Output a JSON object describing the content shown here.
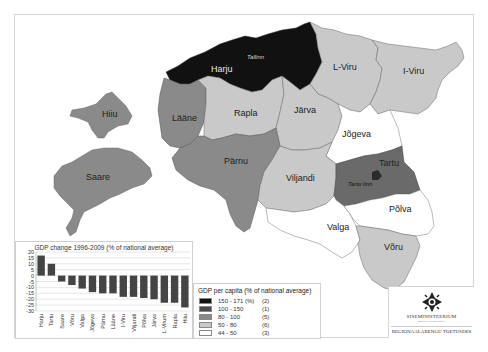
{
  "map": {
    "title": "GDP per capita by county, Estonia",
    "regions": [
      {
        "name": "Harju",
        "class": "150 - 171",
        "fill": "#111111"
      },
      {
        "name": "Tartu",
        "class": "100 - 150",
        "fill": "#6a6a6a"
      },
      {
        "name": "Hiiu",
        "class": "80 - 100",
        "fill": "#8a8a8a"
      },
      {
        "name": "Saare",
        "class": "80 - 100",
        "fill": "#8a8a8a"
      },
      {
        "name": "Lääne",
        "class": "80 - 100",
        "fill": "#8a8a8a"
      },
      {
        "name": "Pärnu",
        "class": "80 - 100",
        "fill": "#8a8a8a"
      },
      {
        "name": "Rapla",
        "class": "50 - 80",
        "fill": "#c9c9c9"
      },
      {
        "name": "Järva",
        "class": "50 - 80",
        "fill": "#c9c9c9"
      },
      {
        "name": "L-Viru",
        "class": "50 - 80",
        "fill": "#c9c9c9"
      },
      {
        "name": "I-Viru",
        "class": "50 - 80",
        "fill": "#c9c9c9"
      },
      {
        "name": "Viljandi",
        "class": "50 - 80",
        "fill": "#c9c9c9"
      },
      {
        "name": "Võru",
        "class": "50 - 80",
        "fill": "#c9c9c9"
      },
      {
        "name": "Jõgeva",
        "class": "44 - 50",
        "fill": "#ffffff"
      },
      {
        "name": "Valga",
        "class": "44 - 50",
        "fill": "#ffffff"
      },
      {
        "name": "Põlva",
        "class": "44 - 50",
        "fill": "#ffffff"
      }
    ],
    "labels": {
      "harju": "Harju",
      "tallinn": "Tallinn",
      "l_viru": "L-Viru",
      "i_viru": "I-Viru",
      "hiiu": "Hiiu",
      "laane": "Lääne",
      "rapla": "Rapla",
      "jarva": "Järva",
      "jogeva": "Jõgeva",
      "saare": "Saare",
      "parnu": "Pärnu",
      "viljandi": "Viljandi",
      "tartu": "Tartu",
      "tartu_linn": "Tartu linn",
      "valga": "Valga",
      "polva": "Põlva",
      "voru": "Võru"
    }
  },
  "legend": {
    "title": "GDP per capita (% of national average)",
    "items": [
      {
        "range": "150 - 171 (%)",
        "count": "(2)",
        "color": "#111111"
      },
      {
        "range": "100 - 150",
        "count": "(1)",
        "color": "#4a4a4a"
      },
      {
        "range": "80 - 100",
        "count": "(5)",
        "color": "#8a8a8a"
      },
      {
        "range": "50 - 80",
        "count": "(6)",
        "color": "#c9c9c9"
      },
      {
        "range": "44 - 50",
        "count": "(3)",
        "color": "#ffffff"
      }
    ]
  },
  "chart_data": {
    "type": "bar",
    "title": "GDP change 1996-2009 (% of national average)",
    "xlabel": "",
    "ylabel": "",
    "categories": [
      "Harju",
      "Tartu",
      "Saare",
      "Võru",
      "Valga",
      "Jõgeva",
      "Pärnu",
      "Lääne",
      "I-Viru",
      "Viljandi",
      "Põlva",
      "Järva",
      "L-Virum",
      "Rapla",
      "Hiiu"
    ],
    "values": [
      17,
      10,
      -5,
      -8,
      -11,
      -14,
      -15,
      -15,
      -18,
      -18,
      -19,
      -20,
      -23,
      -23,
      -27
    ],
    "yticks": [
      20,
      15,
      10,
      5,
      0,
      -5,
      -10,
      -15,
      -20,
      -25,
      -30
    ],
    "ytick_labels": [
      "20",
      "15",
      "10",
      "5",
      "0",
      "-5",
      "-10",
      "-15",
      "-20",
      "-25",
      "-30"
    ],
    "ylim": [
      -30,
      20
    ],
    "grid": true,
    "bar_color": "#444444"
  },
  "logo": {
    "name": "SISEMINISTEERIUM",
    "subtitle": "ministry of internal affairs",
    "department": "REGIONAALARENGU TOETUSEKS"
  }
}
